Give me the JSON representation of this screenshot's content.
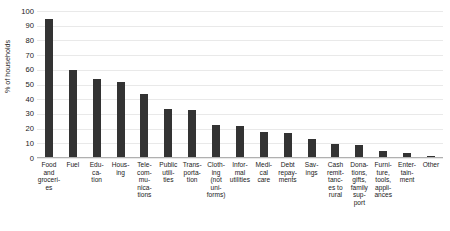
{
  "chart_data": {
    "type": "bar",
    "title": "Expenditure types paid by households",
    "xlabel": "",
    "ylabel": "% of households",
    "ylim": [
      0,
      100
    ],
    "ytick_labels": [
      "100",
      "90",
      "80",
      "70",
      "60",
      "50",
      "40",
      "30",
      "20",
      "10",
      "0"
    ],
    "yticks": [
      100,
      90,
      80,
      70,
      60,
      50,
      40,
      30,
      20,
      10,
      0
    ],
    "grid": true,
    "legend": "none",
    "bar_color": "#333333",
    "gridline_color": "#e9e9e9",
    "categories": [
      "Food and groceries",
      "Fuel",
      "Education",
      "Housing",
      "Telecommunications",
      "Public utilities",
      "Transportation",
      "Clothing (not uniforms)",
      "Informal utilities",
      "Medical care",
      "Debt repayments",
      "Savings",
      "Cash remittances to rural",
      "Donations, gifts, family support",
      "Furniture, tools, appliances",
      "Entertainment",
      "Other"
    ],
    "category_labels_wrapped": [
      "Food\nand\ngroceri-\nes",
      "Fuel",
      "Edu-\nca-\ntion",
      "Hous-\ning",
      "Tele-\ncom-\nmu-\nnica-\ntions",
      "Public\nutili-\nties",
      "Trans-\nporta-\ntion",
      "Cloth-\ning\n(not\nuni-\nforms)",
      "Infor-\nmal\nutilities",
      "Medi-\ncal\ncare",
      "Debt\nrepay-\nments",
      "Sav-\nings",
      "Cash\nremit-\ntanc-\nes to\nrural",
      "Dona-\ntions,\ngifts,\nfamily\nsup-\nport",
      "Furni-\nture,\ntools,\nappli-\nances",
      "Enter-\ntain-\nment",
      "Other"
    ],
    "values": [
      94,
      59,
      53,
      51,
      43,
      33,
      32,
      22,
      21,
      17,
      16,
      12,
      9,
      8,
      4,
      3,
      1
    ]
  }
}
